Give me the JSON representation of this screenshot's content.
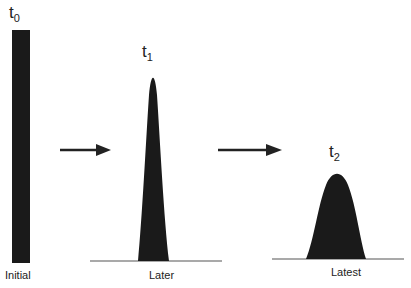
{
  "diagram": {
    "stages": [
      {
        "time_symbol": "t",
        "time_subscript": "0",
        "caption": "Initial",
        "shape": "tall-narrow-bar"
      },
      {
        "time_symbol": "t",
        "time_subscript": "1",
        "caption": "Later",
        "shape": "tall-narrow-peak"
      },
      {
        "time_symbol": "t",
        "time_subscript": "2",
        "caption": "Latest",
        "shape": "short-broad-peak"
      }
    ],
    "arrows": [
      {
        "from": "Initial",
        "to": "Later",
        "icon": "right-arrow-icon"
      },
      {
        "from": "Later",
        "to": "Latest",
        "icon": "right-arrow-icon"
      }
    ],
    "colors": {
      "fill": "#1a1a1a",
      "baseline": "#555555",
      "text": "#222222"
    }
  }
}
